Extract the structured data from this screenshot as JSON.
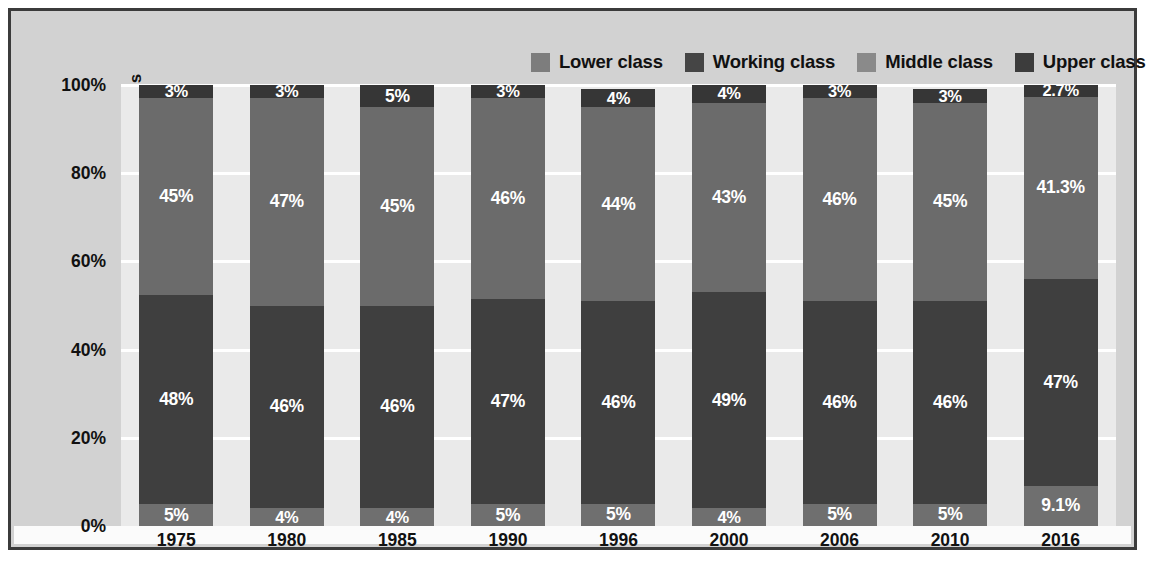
{
  "chart_data": {
    "type": "bar",
    "subtype": "stacked-100-percent",
    "title": "",
    "xlabel": "",
    "ylabel": "Proportion of Americans",
    "ylim": [
      0,
      100
    ],
    "ytick_labels": [
      "0%",
      "20%",
      "40%",
      "60%",
      "80%",
      "100%"
    ],
    "ytick_values": [
      0,
      20,
      40,
      60,
      80,
      100
    ],
    "grid": true,
    "legend_position": "top-right",
    "categories": [
      "1975",
      "1980",
      "1985",
      "1990",
      "1996",
      "2000",
      "2006",
      "2010",
      "2016"
    ],
    "stack_order_bottom_to_top": [
      "Lower class",
      "Working class",
      "Middle class",
      "Upper class"
    ],
    "series": [
      {
        "name": "Lower class",
        "color": "#6f6f6f",
        "values": [
          5,
          4,
          4,
          5,
          5,
          4,
          5,
          5,
          9.1
        ],
        "labels": [
          "5%",
          "4%",
          "4%",
          "5%",
          "5%",
          "4%",
          "5%",
          "5%",
          "9.1%"
        ]
      },
      {
        "name": "Working class",
        "color": "#3f3f3f",
        "values": [
          48,
          46,
          46,
          47,
          46,
          49,
          46,
          46,
          47
        ],
        "labels": [
          "48%",
          "46%",
          "46%",
          "47%",
          "46%",
          "49%",
          "46%",
          "46%",
          "47%"
        ]
      },
      {
        "name": "Middle class",
        "color": "#6b6b6b",
        "values": [
          45,
          47,
          45,
          46,
          44,
          43,
          46,
          45,
          41.3
        ],
        "labels": [
          "45%",
          "47%",
          "45%",
          "46%",
          "44%",
          "43%",
          "46%",
          "45%",
          "41.3%"
        ]
      },
      {
        "name": "Upper class",
        "color": "#363636",
        "values": [
          3,
          3,
          5,
          3,
          4,
          4,
          3,
          3,
          2.7
        ],
        "labels": [
          "3%",
          "3%",
          "5%",
          "3%",
          "4%",
          "4%",
          "3%",
          "3%",
          "2.7%"
        ]
      }
    ]
  },
  "legend": {
    "items": [
      {
        "label": "Lower class",
        "color": "#7d7d7d"
      },
      {
        "label": "Working class",
        "color": "#454545"
      },
      {
        "label": "Middle class",
        "color": "#8a8a8a"
      },
      {
        "label": "Upper class",
        "color": "#3c3c3c"
      }
    ]
  },
  "colors": {
    "frame_border": "#3b3b3b",
    "outer_background": "#d2d2d2",
    "plot_background": "#eaeaea",
    "gridline": "#ffffff",
    "text": "#111111",
    "value_label_text": "#ffffff",
    "xaxis_band": "#fbfbfb"
  }
}
